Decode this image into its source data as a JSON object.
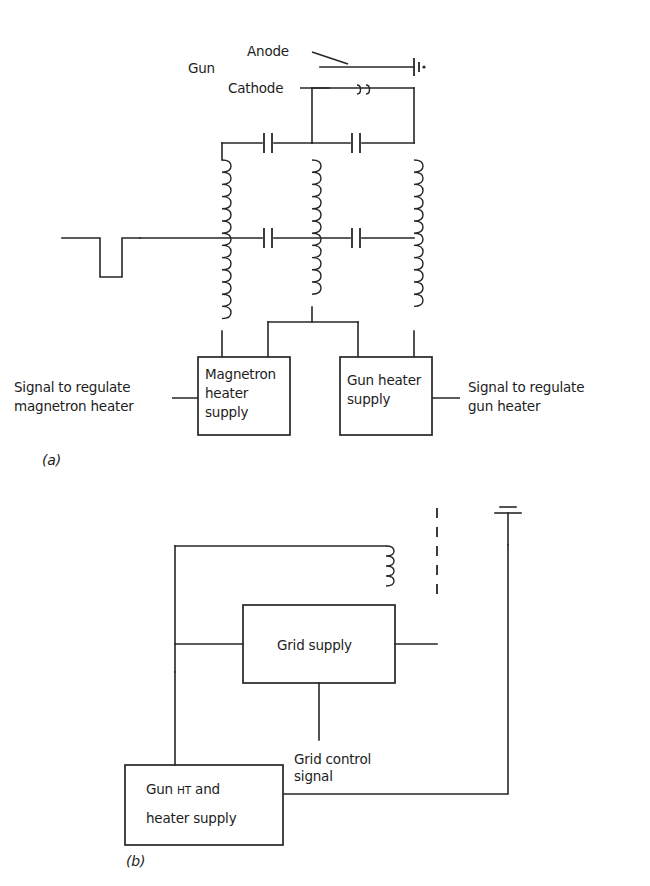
{
  "figure": {
    "panels": [
      {
        "tag": "(a)",
        "labels": {
          "gun": "Gun",
          "anode": "Anode",
          "cathode": "Cathode",
          "signal_left_line1": "Signal to regulate",
          "signal_left_line2": "magnetron heater",
          "signal_right_line1": "Signal to regulate",
          "signal_right_line2": "gun heater"
        },
        "boxes": [
          {
            "name": "magnetron-heater-supply",
            "lines": [
              "Magnetron",
              "heater",
              "supply"
            ]
          },
          {
            "name": "gun-heater-supply",
            "lines": [
              "Gun heater",
              "supply"
            ]
          }
        ],
        "components": {
          "inductors": 3,
          "capacitors": 4,
          "waveform": "negative-going-pulse",
          "filament_marker": "oo",
          "terminal_symbol": "anode-terminal"
        }
      },
      {
        "tag": "(b)",
        "labels": {
          "grid_control_line1": "Grid control",
          "grid_control_line2": "signal"
        },
        "boxes": [
          {
            "name": "grid-supply",
            "lines": [
              "Grid supply"
            ]
          },
          {
            "name": "gun-ht-and-heater-supply",
            "lines": [
              "Gun HT and",
              "heater supply"
            ],
            "small_caps_part": "HT"
          }
        ],
        "components": {
          "inductors": 1,
          "earth_symbol": "earth-ground",
          "dashed_connection": true
        }
      }
    ],
    "colors": {
      "line": "#262626",
      "text": "#1d1d1d",
      "background": "#ffffff"
    }
  }
}
